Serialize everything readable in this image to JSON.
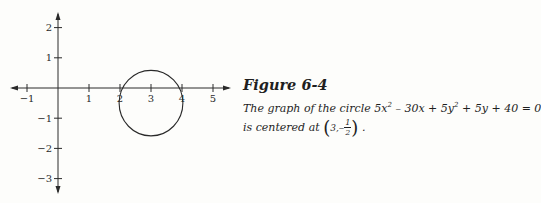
{
  "chart_data": {
    "type": "line",
    "title": "Figure 6-4",
    "xlabel": "",
    "ylabel": "",
    "xlim": [
      -1.5,
      5.5
    ],
    "ylim": [
      -3.5,
      2.5
    ],
    "x_ticks": [
      -1,
      1,
      2,
      3,
      4,
      5
    ],
    "y_ticks": [
      2,
      1,
      -1,
      -2,
      -3
    ],
    "grid": false,
    "legend": null,
    "series": [
      {
        "name": "circle 5x^2 - 30x + 5y^2 + 5y + 40 = 0",
        "shape": "circle",
        "center": [
          3,
          -0.5
        ],
        "radius": 1.118
      }
    ]
  },
  "caption": {
    "title": "Figure 6-4",
    "line1": "The graph of the circle 5x² – 30x + 5y² + 5y + 40 = 0",
    "line2_prefix": "is centered at",
    "center_x": "3,",
    "center_y_sign": "–",
    "frac_num": "1",
    "frac_den": "2",
    "line2_suffix": "."
  },
  "equation_parts": {
    "p1": "The graph of the circle 5x",
    "exp1": "2",
    "p2": " – 30x + 5y",
    "exp2": "2",
    "p3": " + 5y + 40 = 0"
  }
}
